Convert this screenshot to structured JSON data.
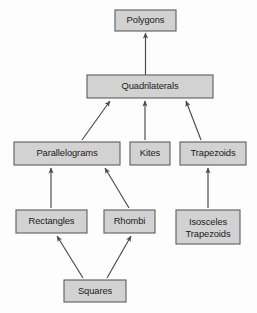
{
  "diagram": {
    "background_color": "#fdfdfd",
    "node_fill_color": "#d2d2d2",
    "node_border_color": "#5d5d5d",
    "edge_color": "#4a4a4a",
    "nodes": [
      {
        "id": "polygons",
        "label": "Polygons",
        "label_line2": "",
        "x": 115,
        "y": 10,
        "w": 61,
        "h": 21,
        "level": 1
      },
      {
        "id": "quadrilaterals",
        "label": "Quadrilaterals",
        "label_line2": "",
        "x": 87,
        "y": 75,
        "w": 126,
        "h": 23,
        "level": 2
      },
      {
        "id": "parallelograms",
        "label": "Parallelograms",
        "label_line2": "",
        "x": 14,
        "y": 142,
        "w": 106,
        "h": 23,
        "level": 3
      },
      {
        "id": "kites",
        "label": "Kites",
        "label_line2": "",
        "x": 130,
        "y": 142,
        "w": 40,
        "h": 23,
        "level": 3
      },
      {
        "id": "trapezoids",
        "label": "Trapezoids",
        "label_line2": "",
        "x": 180,
        "y": 142,
        "w": 66,
        "h": 23,
        "level": 3
      },
      {
        "id": "rectangles",
        "label": "Rectangles",
        "label_line2": "",
        "x": 16,
        "y": 210,
        "w": 71,
        "h": 23,
        "level": 4
      },
      {
        "id": "rhombi",
        "label": "Rhombi",
        "label_line2": "",
        "x": 104,
        "y": 210,
        "w": 51,
        "h": 23,
        "level": 4
      },
      {
        "id": "isosceles_trapezoids",
        "label": "Isosceles",
        "label_line2": "Trapezoids",
        "x": 176,
        "y": 210,
        "w": 64,
        "h": 34,
        "level": 4
      },
      {
        "id": "squares",
        "label": "Squares",
        "label_line2": "",
        "x": 64,
        "y": 280,
        "w": 62,
        "h": 22,
        "level": 5
      }
    ],
    "edges": [
      {
        "from": "quadrilaterals",
        "to": "polygons",
        "x1": 145.5,
        "y1": 75,
        "x2": 145.5,
        "y2": 33
      },
      {
        "from": "parallelograms",
        "to": "quadrilaterals",
        "x1": 82,
        "y1": 140,
        "x2": 110,
        "y2": 101
      },
      {
        "from": "kites",
        "to": "quadrilaterals",
        "x1": 145,
        "y1": 140,
        "x2": 145,
        "y2": 101
      },
      {
        "from": "trapezoids",
        "to": "quadrilaterals",
        "x1": 201,
        "y1": 140,
        "x2": 186,
        "y2": 101
      },
      {
        "from": "rectangles",
        "to": "parallelograms",
        "x1": 51,
        "y1": 208,
        "x2": 51,
        "y2": 168
      },
      {
        "from": "rhombi",
        "to": "parallelograms",
        "x1": 129,
        "y1": 208,
        "x2": 105,
        "y2": 168
      },
      {
        "from": "isosceles_trapezoids",
        "to": "trapezoids",
        "x1": 208,
        "y1": 208,
        "x2": 208,
        "y2": 168
      },
      {
        "from": "squares",
        "to": "rectangles",
        "x1": 83,
        "y1": 278,
        "x2": 57,
        "y2": 236
      },
      {
        "from": "squares",
        "to": "rhombi",
        "x1": 107,
        "y1": 278,
        "x2": 131,
        "y2": 236
      }
    ]
  }
}
